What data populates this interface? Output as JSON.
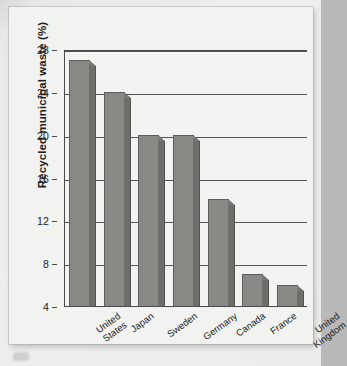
{
  "chart_data": {
    "type": "bar",
    "title": "",
    "xlabel": "",
    "ylabel": "Recycled municipal waste (%)",
    "categories": [
      "United States",
      "Japan",
      "Sweden",
      "Germany",
      "Canada",
      "France",
      "United Kingdom"
    ],
    "values": [
      27,
      24,
      20,
      20,
      14,
      7,
      6
    ],
    "ylim": [
      4,
      28
    ],
    "yticks": [
      28,
      24,
      20,
      16,
      12,
      8,
      4
    ],
    "ytick_labels": [
      "28",
      "24",
      "20",
      "16",
      "12",
      "8",
      "4"
    ],
    "grid": true,
    "legend": "none",
    "series": [
      {
        "name": "Recycled municipal waste",
        "values": [
          27,
          24,
          20,
          20,
          14,
          7,
          6
        ]
      }
    ],
    "colors": {
      "bar_face": "#8b8b87",
      "bar_side": "#6d6d69",
      "bar_outline": "#5d5d59",
      "axis": "#4a4a4a",
      "gridline": "#55554f",
      "plot_background": "#f3f3f1",
      "card_background": "#f2f2f0",
      "page_background": "#ececea",
      "text": "#1d1d1a"
    }
  }
}
